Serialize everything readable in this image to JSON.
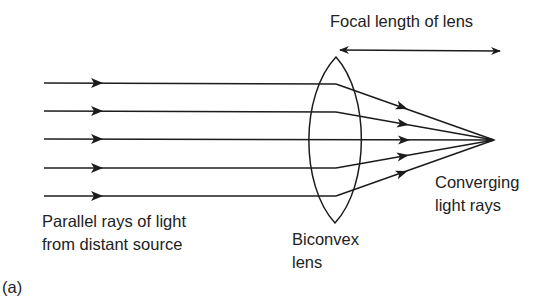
{
  "figure": {
    "panel_label": "(a)",
    "labels": {
      "focal_length": "Focal length of lens",
      "parallel_line1": "Parallel rays of light",
      "parallel_line2": "from distant source",
      "lens_line1": "Biconvex",
      "lens_line2": "lens",
      "converging_line1": "Converging",
      "converging_line2": "light rays"
    },
    "colors": {
      "ink": "#1c1c1c",
      "background": "#ffffff"
    },
    "geometry": {
      "ray_count": 5,
      "ray_y": [
        83,
        111,
        139,
        168,
        196
      ],
      "ray_start_x": 44,
      "lens_center_x": 336,
      "focal_point": [
        494,
        140
      ]
    }
  }
}
